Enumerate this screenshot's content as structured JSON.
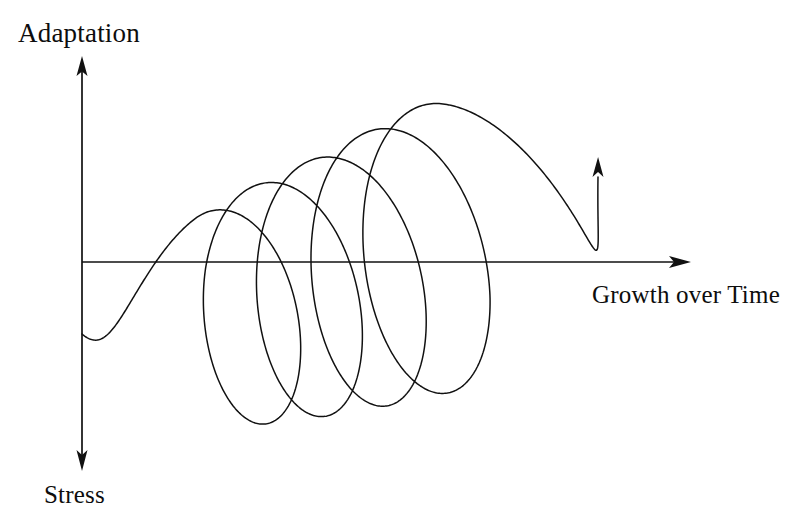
{
  "figure": {
    "title_visible": false,
    "background_color": "#ffffff",
    "line_color": "#111111"
  },
  "axes": {
    "vertical": {
      "top_label": "Adaptation",
      "bottom_label": "Stress",
      "x": 82,
      "y_top": 57,
      "y_bottom": 470,
      "arrow_top": true,
      "arrow_bottom": true
    },
    "horizontal": {
      "label": "Growth over Time",
      "y": 262,
      "x_left": 82,
      "x_right": 690,
      "arrow_right": true
    }
  },
  "labels": {
    "adaptation": "Adaptation",
    "stress": "Stress",
    "growth_over_time": "Growth over Time"
  },
  "chart_data": {
    "type": "line",
    "title": "",
    "xlabel": "Growth over Time",
    "ylabel_positive": "Adaptation",
    "ylabel_negative": "Stress",
    "grid": false,
    "legend": false,
    "loop_count": 5,
    "start_point": [
      82,
      334
    ],
    "end_arrow_tip": [
      598,
      163
    ],
    "loops": [
      {
        "index": 1,
        "center_x": 203,
        "center_y": 326,
        "rx": 53,
        "ry": 104,
        "tilt_deg": -6
      },
      {
        "index": 2,
        "center_x": 268,
        "center_y": 305,
        "rx": 62,
        "ry": 118,
        "tilt_deg": -7
      },
      {
        "index": 3,
        "center_x": 341,
        "center_y": 284,
        "rx": 68,
        "ry": 129,
        "tilt_deg": -8
      },
      {
        "index": 4,
        "center_x": 415,
        "center_y": 258,
        "rx": 73,
        "ry": 139,
        "tilt_deg": -9
      },
      {
        "index": 5,
        "center_x": 479,
        "center_y": 236,
        "rx": 76,
        "ry": 147,
        "tilt_deg": -10
      }
    ],
    "x_extent_px": [
      82,
      690
    ],
    "y_extent_px": [
      57,
      470
    ]
  },
  "icons": {
    "arrow_up": "arrow-up-icon",
    "arrow_down": "arrow-down-icon",
    "arrow_right": "arrow-right-icon",
    "spiral": "spiral-icon"
  }
}
